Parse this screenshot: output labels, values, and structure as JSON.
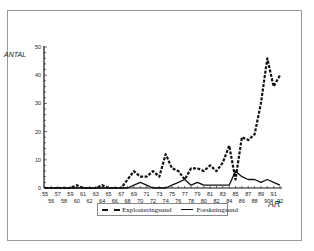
{
  "chart_data": {
    "type": "line",
    "title": "",
    "xlabel": "ÅR",
    "ylabel": "ANTAL",
    "ylim": [
      0,
      50
    ],
    "yticks": [
      0,
      10,
      20,
      30,
      40,
      50
    ],
    "xlim": [
      55,
      92
    ],
    "x": [
      55,
      56,
      57,
      58,
      59,
      60,
      61,
      62,
      63,
      64,
      65,
      66,
      67,
      68,
      69,
      70,
      71,
      72,
      73,
      74,
      75,
      76,
      77,
      78,
      79,
      80,
      81,
      82,
      83,
      84,
      85,
      86,
      87,
      88,
      89,
      90,
      91,
      92
    ],
    "x_tick_labels_top": [
      "55",
      "57",
      "59",
      "61",
      "63",
      "65",
      "67",
      "69",
      "71",
      "73",
      "75",
      "77",
      "79",
      "81",
      "83",
      "85",
      "87",
      "89",
      "91"
    ],
    "x_tick_labels_bottom": [
      "56",
      "58",
      "60",
      "62",
      "64",
      "66",
      "68",
      "70",
      "72",
      "74",
      "76",
      "78",
      "80",
      "82",
      "84",
      "86",
      "88",
      "90",
      "92"
    ],
    "grid": false,
    "legend_position": "bottom-center",
    "series": [
      {
        "name": "Exploateringsund",
        "style": "dashed",
        "values": [
          0,
          0,
          0,
          0,
          0,
          1,
          0,
          0,
          0,
          1,
          0,
          0,
          0,
          3,
          6,
          4,
          4,
          6,
          4,
          12,
          7,
          6,
          3,
          7,
          7,
          6,
          8,
          6,
          9,
          15,
          3,
          18,
          17,
          19,
          30,
          46,
          36,
          40
        ]
      },
      {
        "name": "Forskningsund",
        "style": "solid",
        "values": [
          0,
          0,
          0,
          0,
          0,
          0,
          0,
          0,
          0,
          0,
          0,
          0,
          0,
          0,
          1,
          2,
          1,
          0,
          0,
          0,
          1,
          2,
          3,
          1,
          2,
          1,
          1,
          1,
          1,
          1,
          6,
          4,
          3,
          3,
          2,
          3,
          2,
          1
        ]
      }
    ]
  },
  "legend": {
    "items": [
      {
        "label": "Exploateringsund"
      },
      {
        "label": "Forskningsund"
      }
    ]
  },
  "axes": {
    "y_title": "ANTAL",
    "x_title": "ÅR"
  }
}
